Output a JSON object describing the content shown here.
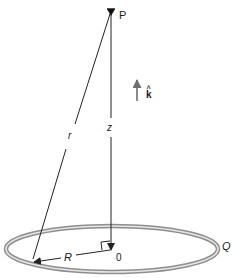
{
  "labels": {
    "point": "P",
    "unit_vector": "k",
    "unit_vector_hat": "^",
    "distance_r": "r",
    "height_z": "z",
    "radius": "R",
    "origin": "0",
    "charge": "Q"
  },
  "colors": {
    "line": "#222222",
    "arrow_k": "#6e6e6e",
    "ring_outer": "#9a9a9a",
    "ring_highlight": "#e8e8e8",
    "text": "#1a1a1a"
  }
}
